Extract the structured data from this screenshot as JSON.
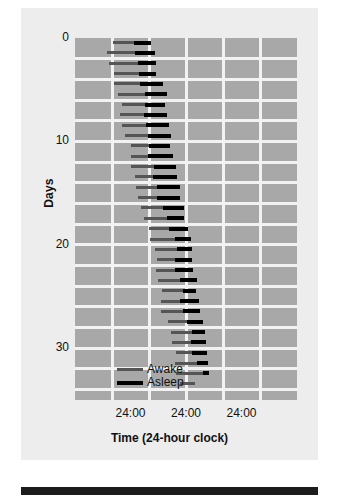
{
  "chart_data": {
    "type": "bar",
    "title": "",
    "subtitle": "",
    "xlabel": "Time (24-hour clock)",
    "ylabel": "Days",
    "grid": true,
    "legend_position": "inside-bottom-left",
    "x_tick_labels": [
      "24:00",
      "24:00",
      "24:00"
    ],
    "x_tick_positions_hours": [
      24,
      48,
      72
    ],
    "xlim_hours": [
      0,
      96
    ],
    "y_tick_labels": [
      "0",
      "10",
      "20",
      "30"
    ],
    "y_tick_values": [
      0,
      10,
      20,
      30
    ],
    "ylim": [
      0,
      35
    ],
    "gridline_hours": [
      16,
      32,
      48,
      64,
      80
    ],
    "series": [
      {
        "name": "Awake",
        "color": "#555555"
      },
      {
        "name": "Asleep",
        "color": "#000000"
      }
    ],
    "days": [
      {
        "day": 0,
        "awake_start": 16.5,
        "awake_end": 25.5,
        "asleep_start": 25.5,
        "asleep_end": 33.0
      },
      {
        "day": 1,
        "awake_start": 14.0,
        "awake_end": 25.8,
        "asleep_start": 25.8,
        "asleep_end": 34.8
      },
      {
        "day": 2,
        "awake_start": 14.6,
        "awake_end": 27.4,
        "asleep_start": 27.4,
        "asleep_end": 35.0
      },
      {
        "day": 3,
        "awake_start": 16.8,
        "awake_end": 27.6,
        "asleep_start": 27.6,
        "asleep_end": 35.0
      },
      {
        "day": 4,
        "awake_start": 17.0,
        "awake_end": 28.0,
        "asleep_start": 28.0,
        "asleep_end": 38.0
      },
      {
        "day": 5,
        "awake_start": 18.6,
        "awake_end": 30.4,
        "asleep_start": 30.4,
        "asleep_end": 39.6
      },
      {
        "day": 6,
        "awake_start": 20.2,
        "awake_end": 30.2,
        "asleep_start": 30.2,
        "asleep_end": 39.0
      },
      {
        "day": 7,
        "awake_start": 19.6,
        "awake_end": 29.8,
        "asleep_start": 29.8,
        "asleep_end": 39.8
      },
      {
        "day": 8,
        "awake_start": 20.4,
        "awake_end": 30.8,
        "asleep_start": 30.8,
        "asleep_end": 40.6
      },
      {
        "day": 9,
        "awake_start": 21.6,
        "awake_end": 31.6,
        "asleep_start": 31.6,
        "asleep_end": 41.6
      },
      {
        "day": 10,
        "awake_start": 24.2,
        "awake_end": 32.0,
        "asleep_start": 32.0,
        "asleep_end": 41.2
      },
      {
        "day": 11,
        "awake_start": 24.0,
        "awake_end": 31.4,
        "asleep_start": 31.4,
        "asleep_end": 42.4
      },
      {
        "day": 12,
        "awake_start": 24.4,
        "awake_end": 34.2,
        "asleep_start": 34.2,
        "asleep_end": 43.8
      },
      {
        "day": 13,
        "awake_start": 25.8,
        "awake_end": 33.8,
        "asleep_start": 33.8,
        "asleep_end": 44.2
      },
      {
        "day": 14,
        "awake_start": 26.4,
        "awake_end": 35.6,
        "asleep_start": 35.6,
        "asleep_end": 45.4
      },
      {
        "day": 15,
        "awake_start": 27.4,
        "awake_end": 35.4,
        "asleep_start": 35.4,
        "asleep_end": 45.6
      },
      {
        "day": 16,
        "awake_start": 28.4,
        "awake_end": 38.0,
        "asleep_start": 38.0,
        "asleep_end": 47.2
      },
      {
        "day": 17,
        "awake_start": 29.8,
        "awake_end": 39.8,
        "asleep_start": 39.8,
        "asleep_end": 47.0
      },
      {
        "day": 18,
        "awake_start": 32.2,
        "awake_end": 40.6,
        "asleep_start": 40.6,
        "asleep_end": 48.8
      },
      {
        "day": 19,
        "awake_start": 32.6,
        "awake_end": 43.2,
        "asleep_start": 43.2,
        "asleep_end": 50.0
      },
      {
        "day": 20,
        "awake_start": 34.4,
        "awake_end": 44.0,
        "asleep_start": 44.0,
        "asleep_end": 50.4
      },
      {
        "day": 21,
        "awake_start": 35.4,
        "awake_end": 43.4,
        "asleep_start": 43.4,
        "asleep_end": 50.4
      },
      {
        "day": 22,
        "awake_start": 35.0,
        "awake_end": 43.2,
        "asleep_start": 43.2,
        "asleep_end": 51.2
      },
      {
        "day": 23,
        "awake_start": 36.0,
        "awake_end": 45.4,
        "asleep_start": 45.4,
        "asleep_end": 52.6
      },
      {
        "day": 24,
        "awake_start": 37.6,
        "awake_end": 46.6,
        "asleep_start": 46.6,
        "asleep_end": 52.4
      },
      {
        "day": 25,
        "awake_start": 37.4,
        "awake_end": 45.6,
        "asleep_start": 45.6,
        "asleep_end": 53.6
      },
      {
        "day": 26,
        "awake_start": 37.2,
        "awake_end": 46.8,
        "asleep_start": 46.8,
        "asleep_end": 54.2
      },
      {
        "day": 27,
        "awake_start": 40.4,
        "awake_end": 48.6,
        "asleep_start": 48.6,
        "asleep_end": 55.2
      },
      {
        "day": 28,
        "awake_start": 41.6,
        "awake_end": 50.6,
        "asleep_start": 50.6,
        "asleep_end": 56.4
      },
      {
        "day": 29,
        "awake_start": 41.8,
        "awake_end": 50.0,
        "asleep_start": 50.0,
        "asleep_end": 56.6
      },
      {
        "day": 30,
        "awake_start": 43.6,
        "awake_end": 50.8,
        "asleep_start": 50.8,
        "asleep_end": 57.0
      },
      {
        "day": 31,
        "awake_start": 43.4,
        "awake_end": 52.8,
        "asleep_start": 52.8,
        "asleep_end": 57.4
      },
      {
        "day": 32,
        "awake_start": 43.6,
        "awake_end": 55.4,
        "asleep_start": 55.4,
        "asleep_end": 58.0
      },
      {
        "day": 33,
        "awake_start": 45.6,
        "awake_end": 52.0,
        "asleep_start": 0,
        "asleep_end": 0
      }
    ]
  },
  "legend": {
    "items": [
      {
        "label": "Awake",
        "color": "#555555"
      },
      {
        "label": "Asleep",
        "color": "#000000"
      }
    ]
  },
  "axes": {
    "y_label": "Days",
    "x_label": "Time (24-hour clock)",
    "y_ticks": [
      "0",
      "10",
      "20",
      "30"
    ],
    "x_ticks": [
      "24:00",
      "24:00",
      "24:00"
    ]
  },
  "colors": {
    "figure_background": "#ededed",
    "plot_background": "#a8a8a8",
    "gridline": "#f2f2f2",
    "awake": "#555555",
    "asleep": "#000000",
    "bottom_bar": "#1c1c1c"
  }
}
